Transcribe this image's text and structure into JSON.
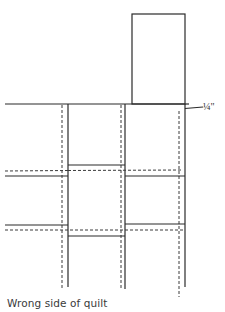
{
  "diagram": {
    "caption": "Wrong side of quilt",
    "measurement_label": "¼\"",
    "colors": {
      "line": "#2a2a2a",
      "dashed_line": "#3a3a3a",
      "text": "#333333",
      "background": "#ffffff"
    },
    "elements": {
      "top_block": {
        "x": 132,
        "y": 14,
        "width": 53,
        "height": 90
      },
      "top_seam_line": {
        "x1": 5,
        "x2": 185,
        "y": 104
      },
      "columns": [
        {
          "name": "left",
          "solid_x": 68,
          "dashed_x": 62
        },
        {
          "name": "middle",
          "solid_x": 125,
          "dashed_x": 121
        },
        {
          "name": "right",
          "solid_x": 185,
          "dashed_x": 179
        }
      ],
      "rows": [
        {
          "name": "upper-left",
          "solid_y": 176,
          "dashed_y": 171
        },
        {
          "name": "upper-middle",
          "solid_y": 165,
          "dashed_y": 170
        },
        {
          "name": "upper-right",
          "solid_y": 176,
          "dashed_y": 170
        },
        {
          "name": "lower-left",
          "solid_y": 225,
          "dashed_y": 230
        },
        {
          "name": "lower-middle",
          "solid_y": 236,
          "dashed_y": 230
        },
        {
          "name": "lower-right",
          "solid_y": 224,
          "dashed_y": 230
        }
      ]
    }
  }
}
